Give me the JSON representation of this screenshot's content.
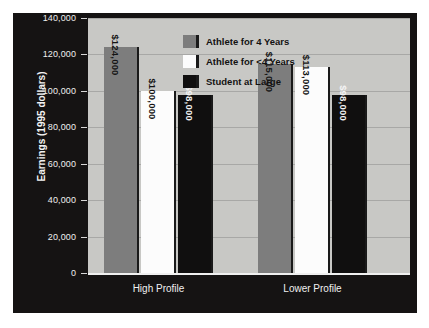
{
  "chart_data": {
    "type": "bar",
    "title": "",
    "xlabel": "",
    "ylabel": "Earnings (1995 dollars)",
    "categories": [
      "High Profile",
      "Lower Profile"
    ],
    "series": [
      {
        "name": "Athlete for 4 Years",
        "values": [
          124000,
          115000
        ],
        "labels": [
          "$124,000",
          "$115,000"
        ],
        "color": "#7d7d7d"
      },
      {
        "name": "Athlete for <4 Years",
        "values": [
          100000,
          113000
        ],
        "labels": [
          "$100,000",
          "$113,000"
        ],
        "color": "#fcfcfc"
      },
      {
        "name": "Student at Large",
        "values": [
          98000,
          98000
        ],
        "labels": [
          "$98,000",
          "$98,000"
        ],
        "color": "#100f0f"
      }
    ],
    "ylim": [
      0,
      140000
    ],
    "yticks": [
      0,
      20000,
      40000,
      60000,
      80000,
      100000,
      120000,
      140000
    ],
    "ytick_labels": [
      "0",
      "20,000",
      "40,000",
      "60,000",
      "80,000",
      "100,000",
      "120,000",
      "140,000"
    ],
    "grid": true,
    "legend_position": "top-center"
  },
  "legend": {
    "items": [
      {
        "label": "Athlete for 4 Years"
      },
      {
        "label": "Athlete for <4 Years"
      },
      {
        "label": "Student at Large"
      }
    ]
  },
  "colors": {
    "panel_background": "#151313",
    "plot_background": "#c8c8c5",
    "gridline": "#a8a8a6",
    "axis_text": "#efefef",
    "series_gray": "#7d7d7d",
    "series_white": "#fcfcfc",
    "series_black": "#100f0f"
  }
}
